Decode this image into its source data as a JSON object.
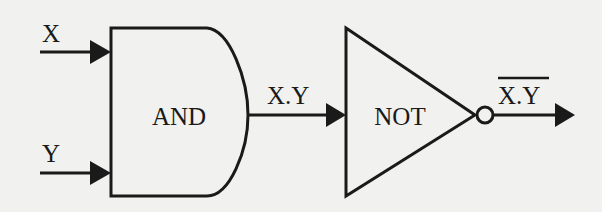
{
  "diagram": {
    "colors": {
      "background": "#f1f1ef",
      "stroke": "#1a1a1a"
    },
    "inputs": [
      {
        "id": "x",
        "label": "X"
      },
      {
        "id": "y",
        "label": "Y"
      }
    ],
    "gates": [
      {
        "id": "and",
        "type": "AND",
        "label": "AND"
      },
      {
        "id": "not",
        "type": "NOT",
        "label": "NOT"
      }
    ],
    "signals": {
      "and_output": "X.Y",
      "final_output": "X.Y",
      "final_output_overlined": true
    },
    "edges": [
      {
        "from": "X",
        "to": "AND"
      },
      {
        "from": "Y",
        "to": "AND"
      },
      {
        "from": "AND",
        "to": "NOT",
        "label": "X.Y"
      },
      {
        "from": "NOT",
        "to": "output",
        "label": "NOT(X.Y)"
      }
    ]
  }
}
